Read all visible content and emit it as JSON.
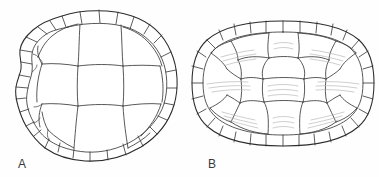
{
  "figure": {
    "kind": "scientific-illustration",
    "background_color": "#fefefe",
    "line_color": "#2b2b2b",
    "striation_color": "#b9b9b9",
    "width": 379,
    "height": 177
  },
  "panels": [
    {
      "id": "A",
      "label": "A",
      "label_x": 18,
      "label_y": 168,
      "description": "angular carapace with broad vertebral scutes and irregular marginal scutes",
      "has_striations": false,
      "outline_shape": "rounded-wedge",
      "center_x": 97,
      "center_y": 85
    },
    {
      "id": "B",
      "label": "B",
      "label_x": 208,
      "label_y": 168,
      "description": "oval carapace with uniform marginal scutes and growth striations",
      "has_striations": true,
      "outline_shape": "oval",
      "center_x": 283,
      "center_y": 83
    }
  ],
  "labels": {
    "panel_a": "A",
    "panel_b": "B"
  }
}
